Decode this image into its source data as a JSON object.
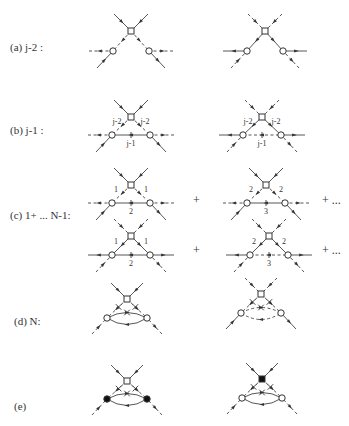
{
  "figure": {
    "rows": [
      {
        "id": "a",
        "label": "(a)  j-2 :",
        "left_label": "",
        "right_labels": [],
        "plus": []
      },
      {
        "id": "b",
        "label": "(b)  j-1 :",
        "edge_labels": [
          "j-2",
          "j-2",
          "j-1"
        ]
      },
      {
        "id": "c",
        "label": "(c) 1+ ... N-1:",
        "top_left_labels": [
          "1",
          "1",
          "2"
        ],
        "top_right_labels": [
          "2",
          "2",
          "3"
        ],
        "bottom_left_labels": [
          "1",
          "1",
          "2"
        ],
        "bottom_right_labels": [
          "2",
          "2",
          "3"
        ],
        "plus": [
          "+",
          "+ ...",
          "+",
          "+ ..."
        ]
      },
      {
        "id": "d",
        "label": "(d) N:"
      },
      {
        "id": "e",
        "label": "(e)"
      }
    ],
    "vertex_legend": {
      "square": "open-square-vertex",
      "circle": "open-circle-vertex",
      "filled_square": "filled-square-vertex",
      "filled_circle": "filled-circle-vertex"
    }
  }
}
